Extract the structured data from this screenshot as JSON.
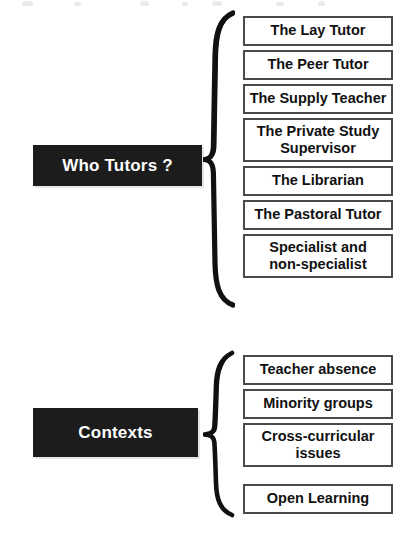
{
  "page": {
    "background_color": "#ffffff",
    "label_bar_color": "#1c1c1c",
    "label_text_color": "#ffffff",
    "box_border_color": "#4a4a4a",
    "box_fill_color": "#ffffff",
    "box_text_color": "#111111"
  },
  "groups": [
    {
      "id": "who-tutors",
      "label": "Who Tutors ?",
      "brace": "left-curly-brace",
      "items": [
        {
          "label": "The Lay Tutor",
          "top": 16,
          "height": 30
        },
        {
          "label": "The Peer Tutor",
          "top": 50,
          "height": 30
        },
        {
          "label": "The Supply Teacher",
          "top": 84,
          "height": 30
        },
        {
          "label": "The Private Study\nSupervisor",
          "top": 118,
          "height": 44
        },
        {
          "label": "The Librarian",
          "top": 166,
          "height": 30
        },
        {
          "label": "The Pastoral Tutor",
          "top": 200,
          "height": 30
        },
        {
          "label": "Specialist and\nnon-specialist",
          "top": 234,
          "height": 44
        }
      ]
    },
    {
      "id": "contexts",
      "label": "Contexts",
      "brace": "left-curly-brace",
      "items": [
        {
          "label": "Teacher absence",
          "top": 355,
          "height": 30
        },
        {
          "label": "Minority groups",
          "top": 389,
          "height": 30
        },
        {
          "label": "Cross-curricular\nissues",
          "top": 423,
          "height": 44
        },
        {
          "label": "Open Learning",
          "top": 484,
          "height": 30
        }
      ]
    }
  ]
}
